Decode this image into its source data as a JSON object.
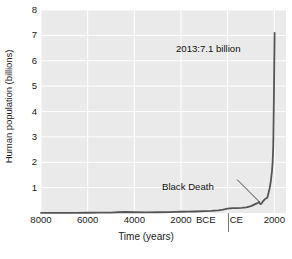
{
  "chart_data": {
    "type": "line",
    "title": "",
    "xlabel": "Time (years)",
    "ylabel": "Human population (billions)",
    "xlim": [
      -8000,
      2500
    ],
    "ylim": [
      0,
      8
    ],
    "grid": true,
    "legend": "none",
    "line_color": "#555555",
    "plot_background": "#eaeaea",
    "gridline_color": "#ffffff",
    "y_ticks": [
      8,
      7,
      6,
      5,
      4,
      3,
      2,
      1
    ],
    "y_tick_labels": [
      "8",
      "7",
      "6",
      "5",
      "4",
      "3",
      "2",
      "1"
    ],
    "x_ticks": [
      -8000,
      -6000,
      -4000,
      -2000,
      0,
      2000
    ],
    "x_tick_labels": [
      "8000",
      "6000",
      "4000",
      "2000",
      "BCE|CE",
      "2000"
    ],
    "era_labels": {
      "before": "BCE",
      "after": "CE"
    },
    "series": [
      {
        "name": "Human population",
        "x": [
          -8000,
          -7500,
          -7000,
          -6500,
          -6000,
          -5500,
          -5000,
          -4700,
          -4400,
          -4000,
          -3500,
          -3000,
          -2500,
          -2200,
          -2000,
          -1700,
          -1400,
          -1000,
          -700,
          -400,
          -200,
          0,
          200,
          400,
          600,
          800,
          1000,
          1200,
          1300,
          1340,
          1400,
          1450,
          1500,
          1600,
          1700,
          1750,
          1800,
          1850,
          1900,
          1927,
          1950,
          1960,
          1974,
          1987,
          1999,
          2013
        ],
        "y": [
          0.005,
          0.006,
          0.007,
          0.008,
          0.01,
          0.013,
          0.018,
          0.03,
          0.04,
          0.03,
          0.027,
          0.03,
          0.035,
          0.045,
          0.05,
          0.055,
          0.06,
          0.07,
          0.08,
          0.1,
          0.13,
          0.17,
          0.19,
          0.19,
          0.2,
          0.22,
          0.27,
          0.36,
          0.4,
          0.44,
          0.35,
          0.37,
          0.45,
          0.55,
          0.6,
          0.79,
          0.98,
          1.26,
          1.65,
          2.0,
          2.52,
          3.0,
          4.0,
          5.0,
          6.0,
          7.1
        ]
      }
    ],
    "annotations": [
      {
        "id": "peak",
        "text": "2013:7.1 billion",
        "points_to_year": 2013,
        "points_to_value": 7.1
      },
      {
        "id": "black-death",
        "text": "Black Death",
        "points_to_year": 1350,
        "points_to_value": 0.37
      }
    ]
  }
}
